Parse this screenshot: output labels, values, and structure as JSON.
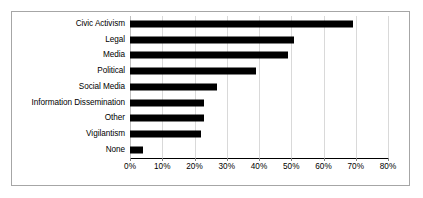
{
  "chart_data": {
    "type": "bar",
    "orientation": "horizontal",
    "title": "",
    "subtitle": "",
    "xlabel": "",
    "ylabel": "",
    "xlim": [
      0,
      80
    ],
    "xticks": [
      0,
      10,
      20,
      30,
      40,
      50,
      60,
      70,
      80
    ],
    "xtick_labels": [
      "0%",
      "10%",
      "20%",
      "30%",
      "40%",
      "50%",
      "60%",
      "70%",
      "80%"
    ],
    "grid": "vertical",
    "legend": "none",
    "bar_color": "#000000",
    "gridline_color": "#d9d9d9",
    "border_color": "#a6a6a6",
    "categories": [
      "Civic Activism",
      "Legal",
      "Media",
      "Political",
      "Social Media",
      "Information Dissemination",
      "Other",
      "Vigilantism",
      "None"
    ],
    "values": [
      69,
      51,
      49,
      39,
      27,
      23,
      23,
      22,
      4
    ],
    "value_unit": "%"
  }
}
